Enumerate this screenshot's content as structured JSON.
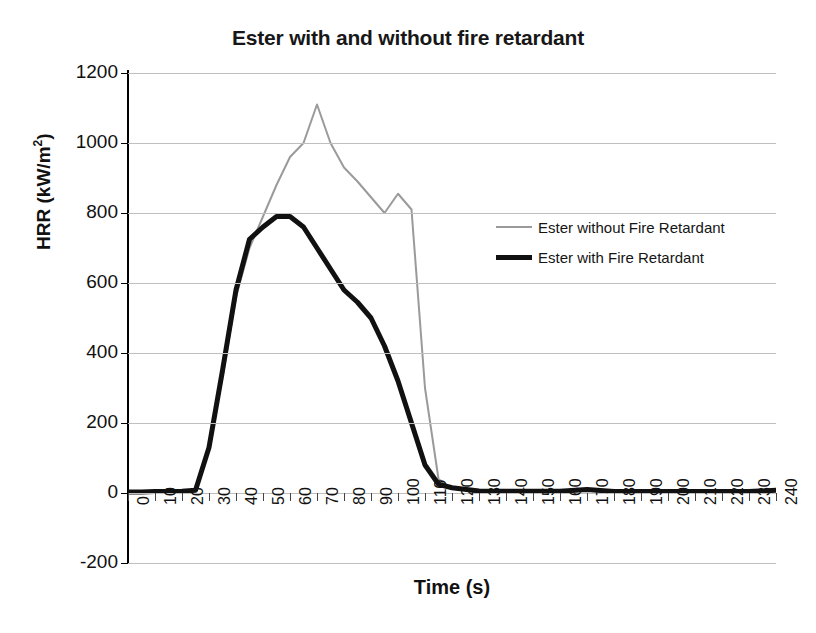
{
  "chart_data": {
    "type": "line",
    "title": "Ester with and without fire retardant",
    "xlabel": "Time (s)",
    "ylabel": "HRR (kW/m²)",
    "ylabel_text": "HRR (kW/m",
    "ylabel_sup": "2",
    "ylabel_tail": ")",
    "xlim": [
      0,
      240
    ],
    "ylim": [
      -200,
      1200
    ],
    "grid": true,
    "legend_position": "center-right",
    "y_ticks": [
      1200,
      1000,
      800,
      600,
      400,
      200,
      0,
      -200
    ],
    "y_tick_labels": [
      "1200",
      "1000",
      "800",
      "600",
      "400",
      "200",
      "0",
      "-200"
    ],
    "x_ticks": [
      0,
      10,
      20,
      30,
      40,
      50,
      60,
      70,
      80,
      90,
      100,
      110,
      120,
      130,
      140,
      150,
      160,
      170,
      180,
      190,
      200,
      210,
      220,
      230,
      240
    ],
    "x_tick_labels": [
      "0",
      "10",
      "20",
      "30",
      "40",
      "50",
      "60",
      "70",
      "80",
      "90",
      "100",
      "110",
      "120",
      "130",
      "140",
      "150",
      "160",
      "170",
      "180",
      "190",
      "200",
      "210",
      "220",
      "230",
      "240"
    ],
    "x": [
      0,
      5,
      10,
      15,
      20,
      25,
      30,
      35,
      40,
      45,
      50,
      55,
      60,
      65,
      70,
      75,
      80,
      85,
      90,
      95,
      100,
      105,
      110,
      115,
      120,
      130,
      140,
      150,
      160,
      170,
      180,
      190,
      200,
      210,
      220,
      230,
      240
    ],
    "series": [
      {
        "name": "Ester without Fire Retardant",
        "color": "#9a9a9a",
        "width": 2,
        "values": [
          3,
          3,
          4,
          4,
          5,
          10,
          130,
          330,
          560,
          700,
          790,
          880,
          960,
          1000,
          1110,
          1000,
          930,
          890,
          845,
          800,
          855,
          810,
          300,
          40,
          12,
          6,
          5,
          5,
          5,
          10,
          4,
          4,
          4,
          4,
          4,
          4,
          8
        ]
      },
      {
        "name": "Ester with Fire Retardant",
        "color": "#111111",
        "width": 5,
        "values": [
          3,
          3,
          4,
          4,
          5,
          8,
          130,
          350,
          580,
          725,
          760,
          790,
          790,
          760,
          700,
          640,
          580,
          545,
          500,
          420,
          320,
          200,
          80,
          25,
          15,
          6,
          5,
          5,
          5,
          10,
          4,
          4,
          4,
          4,
          4,
          4,
          8
        ]
      }
    ]
  },
  "legend": {
    "items": [
      {
        "label": "Ester without Fire Retardant",
        "style": "s-gray"
      },
      {
        "label": "Ester with Fire Retardant",
        "style": "s-black"
      }
    ]
  }
}
